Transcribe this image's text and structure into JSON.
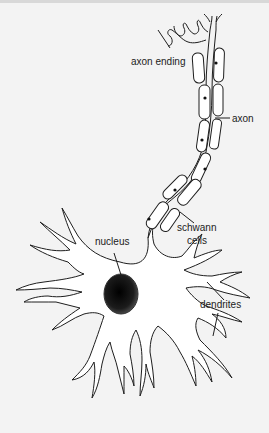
{
  "diagram": {
    "labels": {
      "axon_ending": "axon ending",
      "axon": "axon",
      "schwann_cells_line1": "schwann",
      "schwann_cells_line2": "cells",
      "nucleus": "nucleus",
      "dendrites": "dendrites"
    },
    "colors": {
      "background": "#f3f3f3",
      "outline": "#1e1e1e",
      "nucleus_fill": "#1a1a1a",
      "cell_fill": "#ffffff",
      "text": "#222222"
    }
  }
}
